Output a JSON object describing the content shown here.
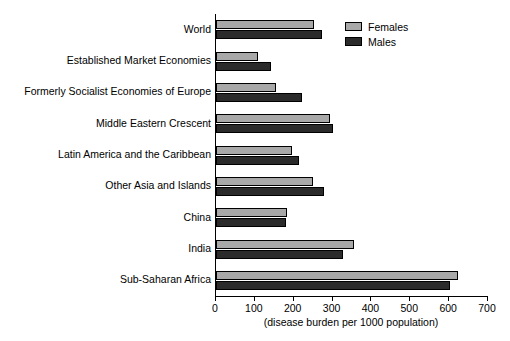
{
  "chart_data": {
    "type": "bar",
    "orientation": "horizontal",
    "title": "",
    "xlabel": "(disease burden per 1000 population)",
    "ylabel": "",
    "xlim": [
      0,
      700
    ],
    "xticks": [
      0,
      100,
      200,
      300,
      400,
      500,
      600,
      700
    ],
    "grid": false,
    "legend_position": "top-right",
    "categories": [
      "World",
      "Established Market Economies",
      "Formerly Socialist Economies of Europe",
      "Middle Eastern Crescent",
      "Latin America and the Caribbean",
      "Other Asia and Islands",
      "China",
      "India",
      "Sub-Saharan Africa"
    ],
    "series": [
      {
        "name": "Females",
        "color": "#a8a8a8",
        "values": [
          253,
          107,
          155,
          293,
          196,
          250,
          183,
          355,
          622
        ]
      },
      {
        "name": "Males",
        "color": "#2b2b2b",
        "values": [
          273,
          142,
          222,
          300,
          214,
          278,
          181,
          327,
          601
        ]
      }
    ]
  },
  "legend": {
    "females_label": "Females",
    "males_label": "Males"
  }
}
